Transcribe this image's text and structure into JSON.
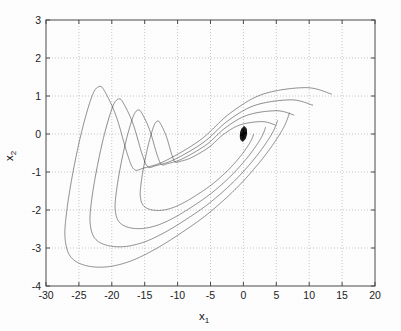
{
  "figure": {
    "title": "",
    "background_color": "#fdfdfd",
    "line_color": "#1a1a1a",
    "grid_color": "#b9b9b9",
    "axis_color": "#4a4a4a"
  },
  "axes": {
    "xlabel_base": "x",
    "xlabel_sub": "1",
    "ylabel_base": "x",
    "ylabel_sub": "2",
    "xtick_labels": [
      "-30",
      "-25",
      "-20",
      "-15",
      "-10",
      "-5",
      "0",
      "5",
      "10",
      "15",
      "20"
    ],
    "ytick_labels": [
      "3",
      "2",
      "1",
      "0",
      "-1",
      "-2",
      "-3",
      "-4"
    ]
  },
  "chart_data": {
    "type": "line",
    "title": "",
    "xlabel": "x_1",
    "ylabel": "x_2",
    "xlim": [
      -30,
      20
    ],
    "ylim": [
      -4,
      3
    ],
    "xticks": [
      -30,
      -25,
      -20,
      -15,
      -10,
      -5,
      0,
      5,
      10,
      15,
      20
    ],
    "yticks": [
      -4,
      -3,
      -2,
      -1,
      0,
      1,
      2,
      3
    ],
    "grid": true,
    "legend": null,
    "legend_position": "none",
    "series": [
      {
        "name": "transient",
        "color": "#2b2b2b",
        "n_points": 1800,
        "x_range": [
          -27.2,
          13.5
        ],
        "y_range": [
          -3.52,
          1.27
        ],
        "key_points": [
          [
            -16.6,
            -0.93
          ],
          [
            -21.9,
            1.25
          ],
          [
            -26.2,
            -1.2
          ],
          [
            -27.1,
            -2.6
          ],
          [
            -24.2,
            -3.45
          ],
          [
            -18.0,
            -3.35
          ],
          [
            -8.0,
            -2.45
          ],
          [
            0.0,
            0.0
          ]
        ]
      },
      {
        "name": "attractor",
        "color": "#1a1a1a",
        "n_points": 120000,
        "x_range": [
          -15.4,
          19.1
        ],
        "y_range": [
          -2.95,
          2.62
        ],
        "left_lobe_center": [
          -5.2,
          1.3
        ],
        "right_lobe_center": [
          5.6,
          -1.1
        ],
        "left_lobe_extent_x": [
          -15.4,
          0.4
        ],
        "right_lobe_extent_x": [
          -0.4,
          19.1
        ],
        "saddle": [
          0,
          0
        ]
      }
    ]
  }
}
